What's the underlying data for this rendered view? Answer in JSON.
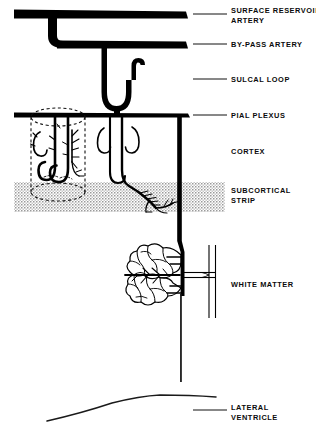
{
  "figure": {
    "background_color": "#ffffff",
    "ink_color": "#000000",
    "stipple_color": "#8a8a8a",
    "width": 316,
    "height": 435
  },
  "labels": [
    {
      "id": "surface-reservoir-artery",
      "line1": "SURFACE RESERVOIR",
      "line2": "ARTERY",
      "x": 231,
      "y": 10,
      "leader": {
        "x1": 193,
        "y1": 14,
        "x2": 227,
        "y2": 14
      }
    },
    {
      "id": "by-pass-artery",
      "line1": "BY-PASS ARTERY",
      "line2": "",
      "x": 231,
      "y": 40,
      "leader": {
        "x1": 193,
        "y1": 44,
        "x2": 227,
        "y2": 44
      }
    },
    {
      "id": "sulcal-loop",
      "line1": "SULCAL LOOP",
      "line2": "",
      "x": 231,
      "y": 75,
      "leader": {
        "x1": 193,
        "y1": 79,
        "x2": 227,
        "y2": 79
      }
    },
    {
      "id": "pial-plexus",
      "line1": "PIAL PLEXUS",
      "line2": "",
      "x": 231,
      "y": 111,
      "leader": {
        "x1": 193,
        "y1": 115,
        "x2": 227,
        "y2": 115
      }
    },
    {
      "id": "cortex",
      "line1": "CORTEX",
      "line2": "",
      "x": 231,
      "y": 147,
      "leader": null
    },
    {
      "id": "subcortical-strip",
      "line1": "SUBCORTICAL",
      "line2": "STRIP",
      "x": 231,
      "y": 190,
      "leader": null
    },
    {
      "id": "white-matter",
      "line1": "WHITE MATTER",
      "line2": "",
      "x": 231,
      "y": 283,
      "leader": null
    },
    {
      "id": "lateral-ventricle",
      "line1": "LATERAL",
      "line2": "VENTRICLE",
      "x": 231,
      "y": 406,
      "leader": {
        "x1": 193,
        "y1": 410,
        "x2": 227,
        "y2": 410
      }
    }
  ],
  "structures": [
    {
      "id": "surface-reservoir-artery-bar",
      "kind": "thick-horizontal-vessel",
      "y": 14,
      "x_start": 14,
      "x_end": 188,
      "thickness": 9
    },
    {
      "id": "by-pass-artery-bar",
      "kind": "thick-horizontal-vessel",
      "y": 44,
      "x_start": 50,
      "x_end": 188,
      "thickness": 8
    },
    {
      "id": "connecting-limb",
      "kind": "vertical-connector",
      "x": 52,
      "y_start": 14,
      "y_end": 44
    },
    {
      "id": "sulcal-loop-vessel",
      "kind": "u-loop-with-hook",
      "x_center": 117,
      "y_start": 44,
      "y_end": 112
    },
    {
      "id": "pial-plexus-bar",
      "kind": "thick-horizontal-vessel",
      "y": 114,
      "x_start": 14,
      "x_end": 190,
      "thickness": 4
    },
    {
      "id": "cortex-penetrators",
      "kind": "branching-vessel-group",
      "region": "cortex"
    },
    {
      "id": "dashed-cylinder",
      "kind": "dashed-cortical-column",
      "x_center": 58,
      "top_y": 116,
      "bottom_y": 200
    },
    {
      "id": "subcortical-strip-band",
      "kind": "stippled-band",
      "x_start": 14,
      "x_end": 225,
      "y_start": 182,
      "y_end": 212
    },
    {
      "id": "long-medullary-artery",
      "kind": "vertical-vessel",
      "x": 180,
      "y_start": 114,
      "y_end": 382
    },
    {
      "id": "white-matter-tuft",
      "kind": "vascular-tuft",
      "x_center": 150,
      "y_center": 283
    },
    {
      "id": "white-matter-anastomosis",
      "kind": "h-shaped-vessel",
      "x_start": 186,
      "x_end": 216,
      "y": 283
    },
    {
      "id": "lateral-ventricle-outline",
      "kind": "curved-boundary",
      "y": 402
    }
  ]
}
